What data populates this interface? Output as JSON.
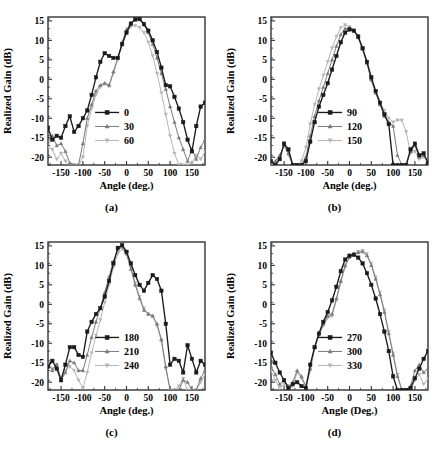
{
  "figure": {
    "title": "",
    "panels": [
      {
        "id": "a",
        "caption": "(a)",
        "xlabel": "Angle (deg.)",
        "ylabel": "Realized Gain (dB)",
        "chart_index": 0
      },
      {
        "id": "b",
        "caption": "(b)",
        "xlabel": "Angle (deg.)",
        "ylabel": "Realized Gain (dB)",
        "chart_index": 1
      },
      {
        "id": "c",
        "caption": "(c)",
        "xlabel": "Angle (deg.)",
        "ylabel": "Realized Gain (dB)",
        "chart_index": 2
      },
      {
        "id": "d",
        "caption": "(d)",
        "xlabel": "Angle (Deg.)",
        "ylabel": "Realized Gain (dB)",
        "chart_index": 3
      }
    ]
  },
  "colors": {
    "series_1": "#1a1a1a",
    "series_2": "#7a7a7a",
    "series_3": "#b5b5b5",
    "axis": "#333333",
    "background": "#ffffff"
  },
  "chart_data": [
    {
      "type": "line",
      "title": "(a)",
      "xlabel": "Angle (deg.)",
      "ylabel": "Realized Gain (dB)",
      "xlim": [
        -180,
        180
      ],
      "ylim": [
        -22,
        16
      ],
      "xticks": [
        -150,
        -100,
        -50,
        0,
        50,
        100,
        150
      ],
      "yticks": [
        -20,
        -15,
        -10,
        -5,
        0,
        5,
        10,
        15
      ],
      "grid": false,
      "legend_position": "lower-center",
      "x": [
        -180,
        -170,
        -160,
        -150,
        -140,
        -130,
        -120,
        -110,
        -100,
        -90,
        -80,
        -70,
        -60,
        -50,
        -40,
        -30,
        -20,
        -10,
        0,
        10,
        20,
        30,
        40,
        50,
        60,
        70,
        80,
        90,
        100,
        110,
        120,
        130,
        140,
        150,
        160,
        170,
        180
      ],
      "series": [
        {
          "name": "0",
          "marker": "square",
          "color": "#1a1a1a",
          "values": [
            -12.5,
            -15.5,
            -14.5,
            -15.0,
            -12.0,
            -9.5,
            -13.5,
            -12.0,
            -10.0,
            -8.0,
            -4.0,
            0.5,
            4.5,
            6.7,
            6.0,
            5.5,
            5.5,
            9.0,
            12.0,
            14.3,
            15.4,
            15.5,
            14.2,
            12.5,
            10.0,
            7.0,
            3.0,
            -1.5,
            -1.8,
            -4.5,
            -7.5,
            -11.0,
            -15.5,
            -18.5,
            -12.0,
            -7.0,
            -6.0
          ]
        },
        {
          "name": "30",
          "marker": "triangle-up",
          "color": "#7a7a7a",
          "values": [
            -16.0,
            -14.5,
            -17.0,
            -16.5,
            -18.5,
            -21.5,
            -22.0,
            -22.0,
            -16.5,
            -10.0,
            -6.5,
            -3.0,
            -1.5,
            -1.0,
            -1.5,
            2.0,
            5.5,
            9.5,
            12.8,
            14.5,
            15.2,
            15.3,
            14.0,
            12.0,
            9.0,
            5.5,
            1.5,
            -2.5,
            -7.0,
            -11.0,
            -15.0,
            -18.0,
            -21.0,
            -18.0,
            -20.5,
            -17.5,
            -15.5
          ]
        },
        {
          "name": "60",
          "marker": "triangle-down",
          "color": "#b5b5b5",
          "values": [
            -17.5,
            -18.0,
            -20.5,
            -19.0,
            -21.0,
            -22.0,
            -22.0,
            -22.0,
            -20.0,
            -12.0,
            -7.5,
            -4.0,
            -2.0,
            -1.2,
            -1.8,
            1.5,
            5.0,
            9.0,
            12.0,
            13.5,
            13.8,
            13.3,
            12.0,
            9.5,
            6.0,
            1.5,
            -3.5,
            -9.0,
            -14.5,
            -19.0,
            -22.0,
            -22.0,
            -22.0,
            -21.5,
            -19.5,
            -20.5,
            -18.5
          ]
        }
      ]
    },
    {
      "type": "line",
      "title": "(b)",
      "xlabel": "Angle (deg.)",
      "ylabel": "Realized Gain (dB)",
      "xlim": [
        -180,
        180
      ],
      "ylim": [
        -22,
        16
      ],
      "xticks": [
        -150,
        -100,
        -50,
        0,
        50,
        100,
        150
      ],
      "yticks": [
        -20,
        -15,
        -10,
        -5,
        0,
        5,
        10,
        15
      ],
      "grid": false,
      "legend_position": "lower-center",
      "x": [
        -180,
        -170,
        -160,
        -150,
        -140,
        -130,
        -120,
        -110,
        -100,
        -90,
        -80,
        -70,
        -60,
        -50,
        -40,
        -30,
        -20,
        -10,
        0,
        10,
        20,
        30,
        40,
        50,
        60,
        70,
        80,
        90,
        100,
        110,
        120,
        130,
        140,
        150,
        160,
        170,
        180
      ],
      "series": [
        {
          "name": "90",
          "marker": "square",
          "color": "#1a1a1a",
          "values": [
            -21.0,
            -22.0,
            -20.5,
            -16.5,
            -18.0,
            -22.0,
            -22.0,
            -22.0,
            -21.0,
            -16.0,
            -11.0,
            -7.0,
            -4.0,
            -1.0,
            2.5,
            6.0,
            9.5,
            12.0,
            12.8,
            12.5,
            11.0,
            8.0,
            4.5,
            0.5,
            -3.0,
            -6.0,
            -9.0,
            -11.5,
            -22.0,
            -22.0,
            -22.0,
            -22.0,
            -18.0,
            -16.5,
            -19.5,
            -19.0,
            -21.5
          ]
        },
        {
          "name": "120",
          "marker": "triangle-up",
          "color": "#7a7a7a",
          "values": [
            -21.5,
            -21.0,
            -19.5,
            -17.0,
            -19.0,
            -22.0,
            -22.0,
            -22.0,
            -20.0,
            -14.5,
            -9.5,
            -5.5,
            -2.0,
            1.5,
            5.0,
            8.5,
            11.5,
            13.0,
            13.2,
            12.5,
            10.8,
            7.8,
            4.2,
            0.0,
            -3.5,
            -6.5,
            -9.5,
            -11.0,
            -12.0,
            -19.5,
            -22.0,
            -22.0,
            -18.5,
            -17.0,
            -20.0,
            -19.5,
            -21.0
          ]
        },
        {
          "name": "150",
          "marker": "triangle-down",
          "color": "#b5b5b5",
          "values": [
            -22.0,
            -21.5,
            -20.0,
            -16.5,
            -19.5,
            -22.0,
            -22.0,
            -21.0,
            -17.5,
            -11.5,
            -6.5,
            -2.5,
            1.0,
            4.5,
            8.0,
            11.0,
            13.2,
            14.0,
            13.5,
            12.5,
            10.5,
            7.5,
            4.0,
            -0.5,
            -3.5,
            -6.0,
            -8.0,
            -10.0,
            -11.0,
            -10.5,
            -10.5,
            -13.5,
            -19.0,
            -18.5,
            -20.5,
            -20.0,
            -21.5
          ]
        }
      ]
    },
    {
      "type": "line",
      "title": "(c)",
      "xlabel": "Angle (deg.)",
      "ylabel": "Realized Gain (dB)",
      "xlim": [
        -180,
        180
      ],
      "ylim": [
        -22,
        16
      ],
      "xticks": [
        -150,
        -100,
        -50,
        0,
        50,
        100,
        150
      ],
      "yticks": [
        -20,
        -15,
        -10,
        -5,
        0,
        5,
        10,
        15
      ],
      "grid": false,
      "legend_position": "lower-center",
      "x": [
        -180,
        -170,
        -160,
        -150,
        -140,
        -130,
        -120,
        -110,
        -100,
        -90,
        -80,
        -70,
        -60,
        -50,
        -40,
        -30,
        -20,
        -10,
        0,
        10,
        20,
        30,
        40,
        50,
        60,
        70,
        80,
        90,
        100,
        110,
        120,
        130,
        140,
        150,
        160,
        170,
        180
      ],
      "series": [
        {
          "name": "180",
          "marker": "square",
          "color": "#1a1a1a",
          "values": [
            -16.0,
            -14.5,
            -16.5,
            -19.5,
            -15.5,
            -11.0,
            -11.0,
            -13.0,
            -13.5,
            -7.0,
            -4.5,
            -2.5,
            -1.0,
            2.0,
            6.0,
            10.5,
            14.5,
            15.2,
            13.5,
            10.5,
            7.5,
            5.0,
            3.5,
            5.5,
            7.5,
            6.5,
            3.5,
            -5.0,
            -15.5,
            -14.0,
            -14.5,
            -17.5,
            -10.5,
            -14.0,
            -17.5,
            -14.5,
            -15.5
          ]
        },
        {
          "name": "210",
          "marker": "triangle-up",
          "color": "#7a7a7a",
          "values": [
            -15.0,
            -17.0,
            -15.5,
            -19.5,
            -17.5,
            -14.5,
            -15.0,
            -17.0,
            -17.0,
            -13.0,
            -8.5,
            -4.5,
            -1.0,
            3.0,
            7.0,
            11.0,
            14.0,
            14.8,
            13.0,
            9.0,
            5.0,
            1.5,
            -1.5,
            -2.5,
            -3.0,
            -5.0,
            -9.0,
            -16.0,
            -22.0,
            -22.0,
            -22.0,
            -19.5,
            -20.0,
            -22.0,
            -22.0,
            -19.0,
            -17.0
          ]
        },
        {
          "name": "240",
          "marker": "triangle-down",
          "color": "#b5b5b5",
          "values": [
            -15.5,
            -16.5,
            -15.5,
            -19.0,
            -17.0,
            -16.0,
            -17.0,
            -19.5,
            -21.5,
            -17.5,
            -12.5,
            -8.0,
            -4.0,
            0.5,
            5.0,
            9.5,
            13.0,
            14.2,
            13.0,
            9.5,
            5.5,
            2.0,
            -1.0,
            -2.5,
            -3.0,
            -5.5,
            -9.5,
            -16.5,
            -22.0,
            -22.0,
            -21.0,
            -19.0,
            -22.0,
            -22.0,
            -22.0,
            -20.0,
            -18.0
          ]
        }
      ]
    },
    {
      "type": "line",
      "title": "(d)",
      "xlabel": "Angle (Deg.)",
      "ylabel": "Realized Gain (dB)",
      "xlim": [
        -180,
        180
      ],
      "ylim": [
        -22,
        16
      ],
      "xticks": [
        -150,
        -100,
        -50,
        0,
        50,
        100,
        150
      ],
      "yticks": [
        -20,
        -15,
        -10,
        -5,
        0,
        5,
        10,
        15
      ],
      "grid": false,
      "legend_position": "lower-center",
      "x": [
        -180,
        -170,
        -160,
        -150,
        -140,
        -130,
        -120,
        -110,
        -100,
        -90,
        -80,
        -70,
        -60,
        -50,
        -40,
        -30,
        -20,
        -10,
        0,
        10,
        20,
        30,
        40,
        50,
        60,
        70,
        80,
        90,
        100,
        110,
        120,
        130,
        140,
        150,
        160,
        170,
        180
      ],
      "series": [
        {
          "name": "270",
          "marker": "square",
          "color": "#1a1a1a",
          "values": [
            -12.5,
            -15.0,
            -17.5,
            -19.5,
            -21.5,
            -20.5,
            -20.0,
            -21.0,
            -21.5,
            -15.5,
            -11.0,
            -7.5,
            -4.5,
            -2.0,
            1.0,
            4.5,
            8.5,
            11.5,
            12.5,
            12.7,
            12.0,
            10.5,
            8.0,
            5.0,
            1.5,
            -2.5,
            -7.0,
            -12.0,
            -18.5,
            -22.0,
            -22.0,
            -22.0,
            -21.5,
            -19.0,
            -16.5,
            -14.0,
            -12.0
          ]
        },
        {
          "name": "300",
          "marker": "triangle-up",
          "color": "#7a7a7a",
          "values": [
            -16.0,
            -18.0,
            -20.5,
            -19.5,
            -21.0,
            -20.0,
            -17.0,
            -18.5,
            -21.0,
            -16.5,
            -11.0,
            -7.5,
            -5.0,
            -3.0,
            -2.5,
            1.5,
            6.0,
            10.0,
            12.2,
            13.0,
            13.3,
            13.5,
            12.5,
            10.0,
            6.5,
            2.5,
            -2.0,
            -7.5,
            -13.0,
            -18.5,
            -22.0,
            -22.0,
            -21.0,
            -17.0,
            -15.5,
            -17.5,
            -16.5
          ]
        },
        {
          "name": "330",
          "marker": "triangle-down",
          "color": "#b5b5b5",
          "values": [
            -17.0,
            -19.5,
            -21.5,
            -20.5,
            -22.0,
            -21.0,
            -17.5,
            -19.0,
            -21.5,
            -17.0,
            -11.5,
            -8.0,
            -5.5,
            -3.5,
            -3.0,
            1.0,
            5.5,
            9.5,
            12.0,
            13.0,
            13.6,
            13.8,
            13.0,
            10.5,
            7.0,
            3.0,
            -1.5,
            -7.0,
            -12.5,
            -18.0,
            -22.0,
            -22.0,
            -22.0,
            -19.5,
            -18.0,
            -20.5,
            -19.0
          ]
        }
      ]
    }
  ]
}
